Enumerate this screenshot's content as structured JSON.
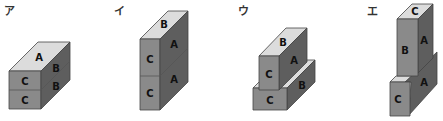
{
  "figures": [
    {
      "id": "a",
      "label": "ア",
      "faces": {
        "top": "A",
        "front_upper": "C",
        "front_lower": "C",
        "side_upper": "B",
        "side_lower": "B"
      }
    },
    {
      "id": "i",
      "label": "イ",
      "faces": {
        "top": "B",
        "front_upper": "C",
        "front_lower": "C",
        "side_upper": "A",
        "side_lower": "A"
      }
    },
    {
      "id": "u",
      "label": "ウ",
      "faces": {
        "top": "B",
        "front_upper": "C",
        "front_lower": "C",
        "side_upper": "A",
        "side_lower": "B"
      }
    },
    {
      "id": "e",
      "label": "エ",
      "faces": {
        "top": "C",
        "front_upper": "B",
        "front_lower": "C",
        "side_upper": "A",
        "side_lower": "A"
      }
    }
  ]
}
